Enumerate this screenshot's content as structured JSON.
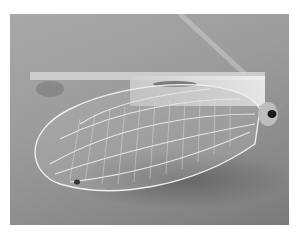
{
  "image": {
    "subject": "lacewing insect with translucent veined wings",
    "style": "grayscale photograph",
    "colors": {
      "background": "#ffffff",
      "photo_bg_light": "#a8a8a8",
      "photo_bg_dark": "#7a7a7a",
      "wing_veins": "#e8e8e8",
      "body_highlight": "#f0f0f0",
      "eye": "#1a1a1a",
      "shadow": "#5e5e5e"
    }
  }
}
